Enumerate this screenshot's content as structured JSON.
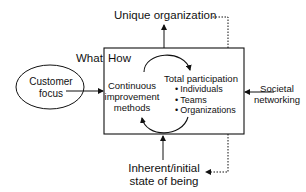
{
  "diagram": {
    "top_label": "Unique organization",
    "bottom_label_lines": [
      "Inherent/initial",
      "state of being"
    ],
    "left_node": {
      "lines": [
        "Customer",
        "focus"
      ]
    },
    "right_label_lines": [
      "Societal",
      "networking"
    ],
    "box": {
      "what_label": "What",
      "how_label": "How",
      "left_text_lines": [
        "Continuous",
        "improvement",
        "methods"
      ],
      "right_title": "Total participation",
      "right_bullets": [
        "Individuals",
        "Teams",
        "Organizations"
      ]
    },
    "colors": {
      "stroke": "#111111",
      "background": "#ffffff"
    }
  }
}
